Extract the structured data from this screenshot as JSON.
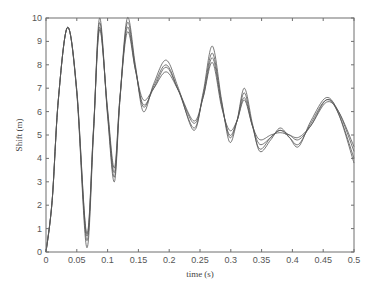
{
  "chart_data": {
    "type": "line",
    "title": "",
    "xlabel": "time (s)",
    "ylabel": "Shift (m)",
    "xlim": [
      0,
      0.5
    ],
    "ylim": [
      0,
      10
    ],
    "xticks": [
      0,
      0.05,
      0.1,
      0.15,
      0.2,
      0.25,
      0.3,
      0.35,
      0.4,
      0.45,
      0.5
    ],
    "xtick_labels": [
      "0",
      "0.05",
      "0.1",
      "0.15",
      "0.2",
      "0.25",
      "0.3",
      "0.35",
      "0.4",
      "0.45",
      "0.5"
    ],
    "yticks": [
      0,
      1,
      2,
      3,
      4,
      5,
      6,
      7,
      8,
      9,
      10
    ],
    "ytick_labels": [
      "0",
      "1",
      "2",
      "3",
      "4",
      "5",
      "6",
      "7",
      "8",
      "9",
      "10"
    ],
    "grid": false,
    "legend": null,
    "line_color": "#555555",
    "x": [
      0,
      0.01,
      0.02,
      0.035,
      0.05,
      0.066,
      0.077,
      0.087,
      0.1,
      0.111,
      0.12,
      0.132,
      0.145,
      0.158,
      0.175,
      0.195,
      0.215,
      0.24,
      0.255,
      0.27,
      0.285,
      0.298,
      0.31,
      0.322,
      0.335,
      0.347,
      0.365,
      0.38,
      0.395,
      0.41,
      0.43,
      0.455,
      0.475,
      0.5
    ],
    "series": [
      {
        "name": "curve 1",
        "values": [
          0,
          2.2,
          6.5,
          9.6,
          6.8,
          0.2,
          5.0,
          10.0,
          5.8,
          3.0,
          6.5,
          10.0,
          8.0,
          6.0,
          7.2,
          8.2,
          7.0,
          5.2,
          6.8,
          8.8,
          6.5,
          4.7,
          5.6,
          7.0,
          5.5,
          4.3,
          4.8,
          5.3,
          4.9,
          4.5,
          5.6,
          6.6,
          5.9,
          3.8
        ]
      },
      {
        "name": "curve 2",
        "values": [
          0,
          2.2,
          6.5,
          9.6,
          6.8,
          0.5,
          5.1,
          9.8,
          5.9,
          3.2,
          6.5,
          9.8,
          7.9,
          6.2,
          7.1,
          8.0,
          6.9,
          5.3,
          6.7,
          8.5,
          6.4,
          4.9,
          5.6,
          6.8,
          5.4,
          4.4,
          4.9,
          5.2,
          4.9,
          4.6,
          5.5,
          6.5,
          5.9,
          4.0
        ]
      },
      {
        "name": "curve 3",
        "values": [
          0,
          2.2,
          6.5,
          9.6,
          6.9,
          0.7,
          5.2,
          9.6,
          6.0,
          3.4,
          6.6,
          9.6,
          7.8,
          6.3,
          7.0,
          7.9,
          6.9,
          5.5,
          6.6,
          8.3,
          6.3,
          5.0,
          5.6,
          6.6,
          5.4,
          4.6,
          4.9,
          5.2,
          5.0,
          4.8,
          5.4,
          6.5,
          6.0,
          4.3
        ]
      },
      {
        "name": "curve 4",
        "values": [
          0,
          2.2,
          6.5,
          9.6,
          6.9,
          0.8,
          5.2,
          9.5,
          6.1,
          3.6,
          6.6,
          9.4,
          7.8,
          6.5,
          7.0,
          7.7,
          6.9,
          5.6,
          6.6,
          8.1,
          6.2,
          5.2,
          5.6,
          6.5,
          5.4,
          4.8,
          5.0,
          5.1,
          5.0,
          4.9,
          5.4,
          6.4,
          6.0,
          4.5
        ]
      }
    ]
  }
}
